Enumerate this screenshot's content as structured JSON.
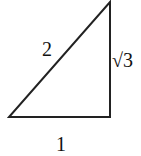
{
  "diagram": {
    "type": "right-triangle",
    "vertices": {
      "bottom_left": [
        9,
        117
      ],
      "bottom_right": [
        110,
        117
      ],
      "top": [
        110,
        2
      ]
    },
    "labels": {
      "hypotenuse": "2",
      "vertical_leg": "√3",
      "horizontal_leg": "1"
    },
    "stroke_color": "#222222"
  }
}
